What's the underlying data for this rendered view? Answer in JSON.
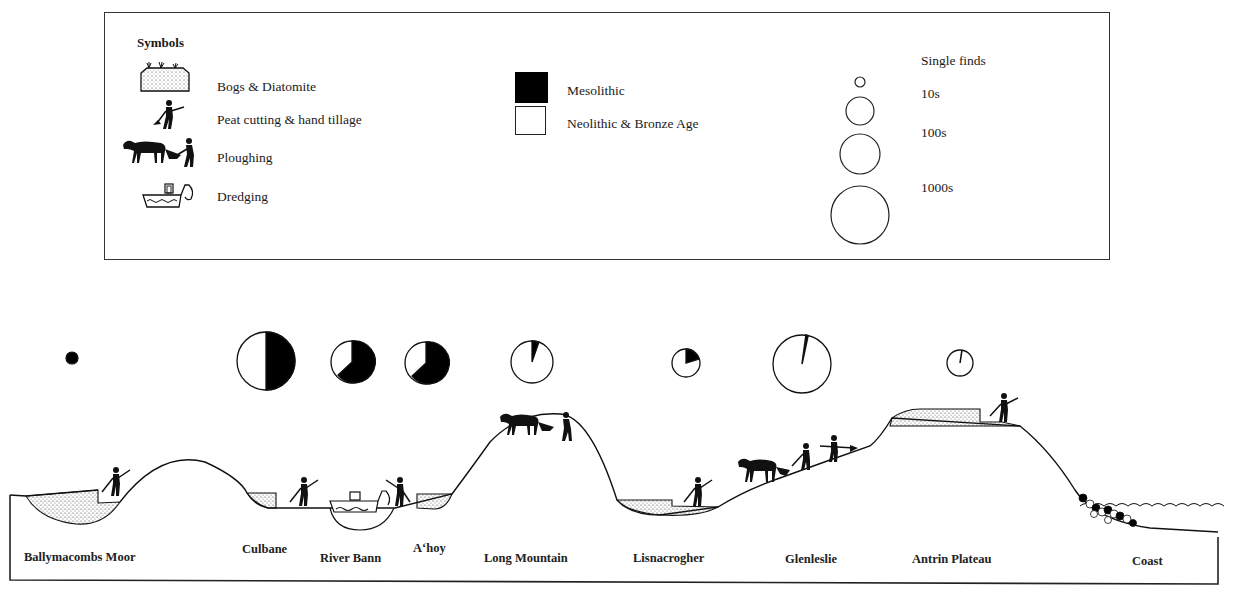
{
  "legend": {
    "title": "Symbols",
    "activities": [
      {
        "icon": "bog-diatomite-icon",
        "label": "Bogs & Diatomite"
      },
      {
        "icon": "peat-cutting-figure-icon",
        "label": "Peat cutting & hand tillage"
      },
      {
        "icon": "horse-plough-icon",
        "label": "Ploughing"
      },
      {
        "icon": "dredger-boat-icon",
        "label": "Dredging"
      }
    ],
    "periods": [
      {
        "swatch": "#000000",
        "label": "Mesolithic"
      },
      {
        "swatch": "#ffffff",
        "label": "Neolithic & Bronze Age"
      }
    ],
    "quantities": [
      {
        "radius": 5,
        "label": "Single finds"
      },
      {
        "radius": 14,
        "label": "10s"
      },
      {
        "radius": 20,
        "label": "100s"
      },
      {
        "radius": 29,
        "label": "1000s"
      }
    ]
  },
  "sites": [
    {
      "name": "Ballymacombs Moor",
      "activity": "Bogs & Diatomite, Peat cutting",
      "quantity": "Single finds",
      "mesolithic_pct": 100
    },
    {
      "name": "Culbane",
      "activity": "Bogs & Diatomite, Peat cutting",
      "quantity": "1000s",
      "mesolithic_pct": 50
    },
    {
      "name": "River Bann",
      "activity": "Dredging",
      "quantity": "100s",
      "mesolithic_pct": 65
    },
    {
      "name": "A'hoy",
      "activity": "Bogs & Diatomite, Peat cutting",
      "quantity": "100s",
      "mesolithic_pct": 65
    },
    {
      "name": "Long Mountain",
      "activity": "Ploughing",
      "quantity": "100s",
      "mesolithic_pct": 5
    },
    {
      "name": "Lisnacrogher",
      "activity": "Bogs & Diatomite, Peat cutting",
      "quantity": "10s",
      "mesolithic_pct": 20
    },
    {
      "name": "Glenleslie",
      "activity": "Ploughing, Hand tillage",
      "quantity": "1000s",
      "mesolithic_pct": 2
    },
    {
      "name": "Antrin Plateau",
      "activity": "Bogs & Diatomite, Peat cutting",
      "quantity": "10s",
      "mesolithic_pct": 1
    },
    {
      "name": "Coast",
      "activity": "Beach",
      "quantity": "",
      "mesolithic_pct": null
    }
  ],
  "labels": {
    "ballymacombs": "Ballymacombs Moor",
    "culbane": "Culbane",
    "river_bann": "River Bann",
    "ahoy": "A‘hoy",
    "long_mountain": "Long Mountain",
    "lisnacrogher": "Lisnacrogher",
    "glenleslie": "Glenleslie",
    "antrin": "Antrin Plateau",
    "coast": "Coast"
  }
}
